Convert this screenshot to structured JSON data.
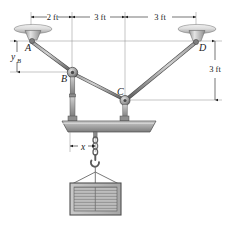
{
  "figure": {
    "background_color": "#ffffff",
    "line_color": "#1a1a1a",
    "cable_color": "#6e6e6e",
    "metal_light": "#d8d8d8",
    "metal_mid": "#a8a8a8",
    "metal_dark": "#707070"
  },
  "dimensions": {
    "top": [
      {
        "id": "dim-a-b",
        "label": "2 ft"
      },
      {
        "id": "dim-b-c",
        "label": "3 ft"
      },
      {
        "id": "dim-c-d",
        "label": "3 ft"
      }
    ],
    "left": {
      "id": "dim-yb",
      "symbol": "y",
      "subscript": "B"
    },
    "right": {
      "id": "dim-vertical-right",
      "label": "3 ft"
    },
    "beam": {
      "id": "dim-x",
      "symbol": "x"
    }
  },
  "points": [
    {
      "id": "point-a",
      "label": "A",
      "x": 31,
      "y": 41
    },
    {
      "id": "point-b",
      "label": "B",
      "x": 72,
      "y": 72
    },
    {
      "id": "point-c",
      "label": "C",
      "x": 125,
      "y": 100
    },
    {
      "id": "point-d",
      "label": "D",
      "x": 196,
      "y": 42
    }
  ],
  "components": {
    "ceiling_mount_left": "ceiling-anchor-plate",
    "ceiling_mount_right": "ceiling-anchor-plate",
    "pulley_b": "pulley-block",
    "pulley_c": "pulley-block",
    "spreader_beam": "spreader-beam",
    "hook": "lifting-hook",
    "crate": "suspended-crate"
  }
}
